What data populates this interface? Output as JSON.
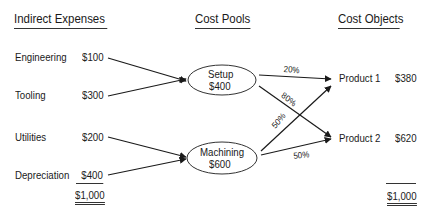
{
  "headers": {
    "expenses": "Indirect Expenses",
    "pools": "Cost Pools",
    "objects": "Cost Objects"
  },
  "expenses": [
    {
      "label": "Engineering",
      "amount": "$100"
    },
    {
      "label": "Tooling",
      "amount": "$300"
    },
    {
      "label": "Utilities",
      "amount": "$200"
    },
    {
      "label": "Depreciation",
      "amount": "$400"
    }
  ],
  "expenses_total": "$1,000",
  "pools": [
    {
      "name": "Setup",
      "amount": "$400"
    },
    {
      "name": "Machining",
      "amount": "$600"
    }
  ],
  "allocations": {
    "setup_to_p1": "20%",
    "setup_to_p2": "80%",
    "machining_to_p1": "50%",
    "machining_to_p2": "50%"
  },
  "objects": [
    {
      "label": "Product 1",
      "amount": "$380"
    },
    {
      "label": "Product 2",
      "amount": "$620"
    }
  ],
  "objects_total": "$1,000",
  "colors": {
    "ink": "#1a1a1a",
    "background": "#ffffff"
  }
}
